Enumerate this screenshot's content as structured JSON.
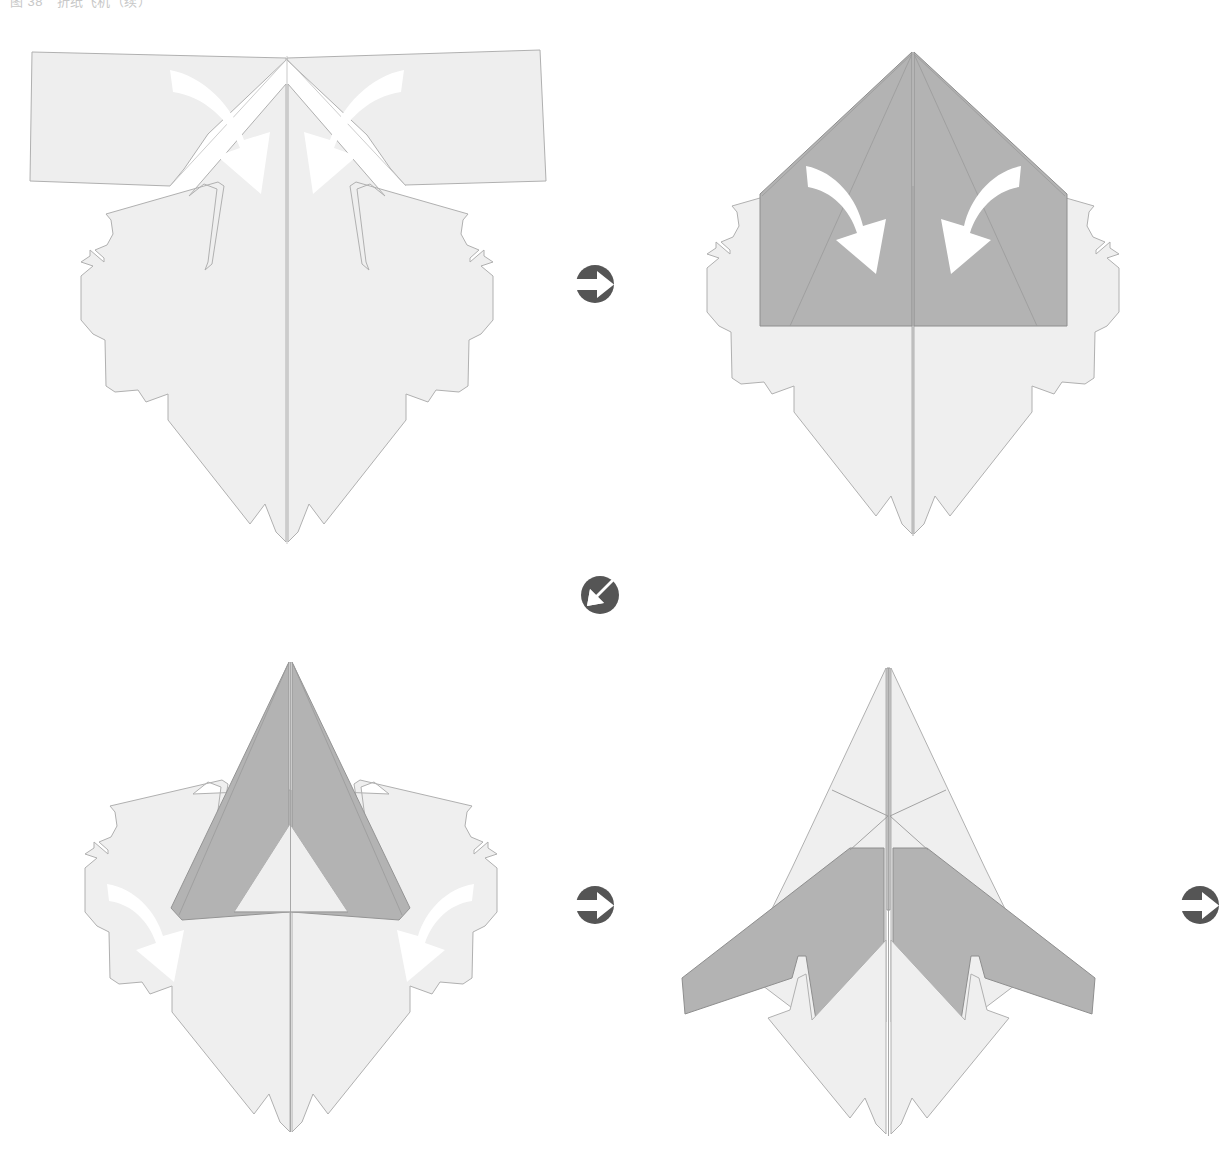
{
  "figure": {
    "caption": "图 38　折纸飞机（续）",
    "kind": "origami-fold-instruction-diagram",
    "background_color": "#ffffff",
    "outline_color": "#b0b0b0",
    "paper_light_color": "#efefef",
    "paper_mid_color": "#e9e9e9",
    "paper_gray_color": "#b3b3b3",
    "paper_gray_dark_color": "#a9a9a9",
    "arrow_color": "#ffffff",
    "connector_color": "#555555"
  },
  "panels": [
    {
      "id": "step-1",
      "step_number": "1",
      "label": "Flat sheet with upper corners to be folded in",
      "arrows": [
        {
          "name": "fold-arrow-left",
          "direction": "curve-down-right"
        },
        {
          "name": "fold-arrow-right",
          "direction": "curve-down-left"
        }
      ]
    },
    {
      "id": "step-2",
      "step_number": "2",
      "label": "Upper corners folded to center forming gray pentagon",
      "arrows": [
        {
          "name": "fold-arrow-left",
          "direction": "curve-down-right"
        },
        {
          "name": "fold-arrow-right",
          "direction": "curve-down-left"
        }
      ]
    },
    {
      "id": "step-3",
      "step_number": "3",
      "label": "Flaps folded up into narrow gray spire",
      "arrows": [
        {
          "name": "fold-arrow-left",
          "direction": "curve-down-right"
        },
        {
          "name": "fold-arrow-right",
          "direction": "curve-down-left"
        }
      ]
    },
    {
      "id": "step-4",
      "step_number": "4",
      "label": "Finished swept-wing paper airplane",
      "arrows": []
    }
  ],
  "connectors": [
    {
      "id": "connector-right-top",
      "name": "next-step-arrow-right",
      "direction": "right",
      "after_panel": "step-1"
    },
    {
      "id": "connector-wrap",
      "name": "next-row-arrow-down-left",
      "direction": "down-left",
      "after_panel": "step-2"
    },
    {
      "id": "connector-right-bottom",
      "name": "next-step-arrow-right",
      "direction": "right",
      "after_panel": "step-3"
    },
    {
      "id": "connector-right-edge",
      "name": "next-step-arrow-right",
      "direction": "right",
      "after_panel": "step-4"
    }
  ]
}
